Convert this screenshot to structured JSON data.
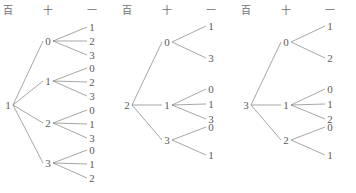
{
  "figure": {
    "line_color": "#808080",
    "text_color": "#5a5a5a",
    "panel_count": 3
  },
  "headers": {
    "hundreds": "百",
    "tens": "十",
    "ones": "一"
  },
  "trees": [
    {
      "id": "tree-1",
      "root": "1",
      "branches": [
        {
          "tens": "0",
          "ones": [
            "1",
            "2",
            "3"
          ]
        },
        {
          "tens": "1",
          "ones": [
            "0",
            "2",
            "3"
          ]
        },
        {
          "tens": "2",
          "ones": [
            "0",
            "1",
            "3"
          ]
        },
        {
          "tens": "3",
          "ones": [
            "0",
            "1",
            "2"
          ]
        }
      ]
    },
    {
      "id": "tree-2",
      "root": "2",
      "branches": [
        {
          "tens": "0",
          "ones": [
            "1",
            "3"
          ]
        },
        {
          "tens": "1",
          "ones": [
            "0",
            "1",
            "3"
          ]
        },
        {
          "tens": "3",
          "ones": [
            "0",
            "1"
          ]
        }
      ]
    },
    {
      "id": "tree-3",
      "root": "3",
      "branches": [
        {
          "tens": "0",
          "ones": [
            "1",
            "2"
          ]
        },
        {
          "tens": "1",
          "ones": [
            "0",
            "1",
            "2"
          ]
        },
        {
          "tens": "2",
          "ones": [
            "0",
            "1"
          ]
        }
      ]
    }
  ],
  "layout": {
    "header_y": 12,
    "col_x": {
      "hundreds": 8,
      "tens": 48,
      "ones": 92
    },
    "header_x": {
      "hundreds": 8,
      "tens": 48,
      "ones": 92
    },
    "panel_width": 118,
    "root_y": 105,
    "tree1_tens_y": [
      41,
      81,
      123,
      163
    ],
    "tree1_ones_y": [
      [
        27,
        41,
        55
      ],
      [
        68,
        82,
        96
      ],
      [
        110,
        124,
        138
      ],
      [
        150,
        164,
        178
      ]
    ],
    "tree2_tens_y": [
      42,
      105,
      140
    ],
    "tree2_ones_y": [
      [
        26,
        58
      ],
      [
        89,
        104,
        119
      ],
      [
        127,
        155
      ]
    ],
    "tree3_tens_y": [
      42,
      105,
      140
    ],
    "tree3_ones_y": [
      [
        26,
        58
      ],
      [
        89,
        104,
        119
      ],
      [
        127,
        155
      ]
    ]
  }
}
